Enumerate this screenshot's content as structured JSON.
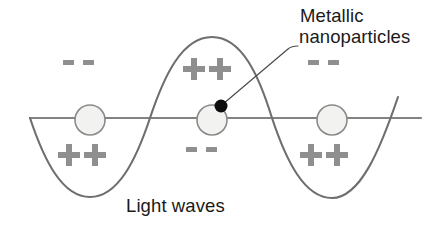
{
  "diagram": {
    "title_label": "Metallic nanoparticles",
    "annotations": {
      "nanoparticles_line1": "Metallic",
      "nanoparticles_line2": "nanoparticles",
      "light_waves": "Light waves"
    },
    "charges": {
      "top_left": "- -",
      "bottom_left": "++",
      "top_center": "++",
      "bottom_center": "- -",
      "top_right": "- -",
      "bottom_right": "++"
    },
    "colors": {
      "wave_stroke": "#6e6e6e",
      "axis_stroke": "#5a5a5a",
      "particle_fill": "#f2f2f0",
      "particle_stroke": "#8a8a8a",
      "marker_dot": "#0d0d0d",
      "charge_symbol": "#8f8f8f",
      "text": "#1a1a1a",
      "background": "#ffffff"
    },
    "geometry": {
      "axis_y": 118,
      "axis_x_start": 30,
      "axis_x_end": 421,
      "wave_amplitude": 81,
      "wave_peak_y": 37,
      "wave_trough_y": 198,
      "particle_radius": 15,
      "particle_centers_x": [
        90,
        212,
        332
      ],
      "particle_center_y": 120,
      "marker_dot_x": 221,
      "marker_dot_y": 106,
      "marker_dot_radius": 6.5
    }
  }
}
